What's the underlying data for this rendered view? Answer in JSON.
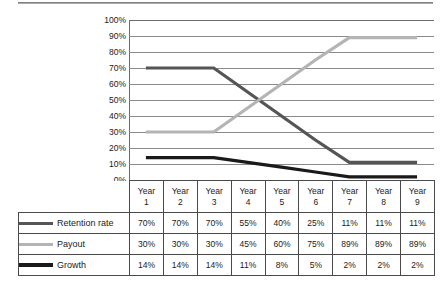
{
  "chart_data": {
    "type": "line",
    "title": "",
    "xlabel": "",
    "ylabel": "",
    "ylim": [
      0,
      100
    ],
    "grid": true,
    "legend_position": "table-left",
    "categories": [
      "Year 1",
      "Year 2",
      "Year 3",
      "Year 4",
      "Year 5",
      "Year 6",
      "Year 7",
      "Year 8",
      "Year 9"
    ],
    "y_ticks": [
      "100%",
      "90%",
      "80%",
      "70%",
      "60%",
      "50%",
      "40%",
      "30%",
      "20%",
      "10%",
      "0%"
    ],
    "series": [
      {
        "name": "Retention rate",
        "color": "#555555",
        "values": [
          70,
          70,
          70,
          55,
          40,
          25,
          11,
          11,
          11
        ],
        "labels": [
          "70%",
          "70%",
          "70%",
          "55%",
          "40%",
          "25%",
          "11%",
          "11%",
          "11%"
        ]
      },
      {
        "name": "Payout",
        "color": "#b4b4b4",
        "values": [
          30,
          30,
          30,
          45,
          60,
          75,
          89,
          89,
          89
        ],
        "labels": [
          "30%",
          "30%",
          "30%",
          "45%",
          "60%",
          "75%",
          "89%",
          "89%",
          "89%"
        ]
      },
      {
        "name": "Growth",
        "color": "#1a1a1a",
        "values": [
          14,
          14,
          14,
          11,
          8,
          5,
          2,
          2,
          2
        ],
        "labels": [
          "14%",
          "14%",
          "14%",
          "11%",
          "8%",
          "5%",
          "2%",
          "2%",
          "2%"
        ]
      }
    ]
  },
  "axis": {
    "y_ticks": [
      "100%",
      "90%",
      "80%",
      "70%",
      "60%",
      "50%",
      "40%",
      "30%",
      "20%",
      "10%",
      "0%"
    ]
  },
  "table": {
    "year_headers": [
      {
        "line1": "Year",
        "line2": "1"
      },
      {
        "line1": "Year",
        "line2": "2"
      },
      {
        "line1": "Year",
        "line2": "3"
      },
      {
        "line1": "Year",
        "line2": "4"
      },
      {
        "line1": "Year",
        "line2": "5"
      },
      {
        "line1": "Year",
        "line2": "6"
      },
      {
        "line1": "Year",
        "line2": "7"
      },
      {
        "line1": "Year",
        "line2": "8"
      },
      {
        "line1": "Year",
        "line2": "9"
      }
    ],
    "rows": [
      {
        "label": "Retention rate",
        "color": "#555555",
        "values": [
          "70%",
          "70%",
          "70%",
          "55%",
          "40%",
          "25%",
          "11%",
          "11%",
          "11%"
        ]
      },
      {
        "label": "Payout",
        "color": "#b4b4b4",
        "values": [
          "30%",
          "30%",
          "30%",
          "45%",
          "60%",
          "75%",
          "89%",
          "89%",
          "89%"
        ]
      },
      {
        "label": "Growth",
        "color": "#1a1a1a",
        "values": [
          "14%",
          "14%",
          "14%",
          "11%",
          "8%",
          "5%",
          "2%",
          "2%",
          "2%"
        ]
      }
    ]
  }
}
